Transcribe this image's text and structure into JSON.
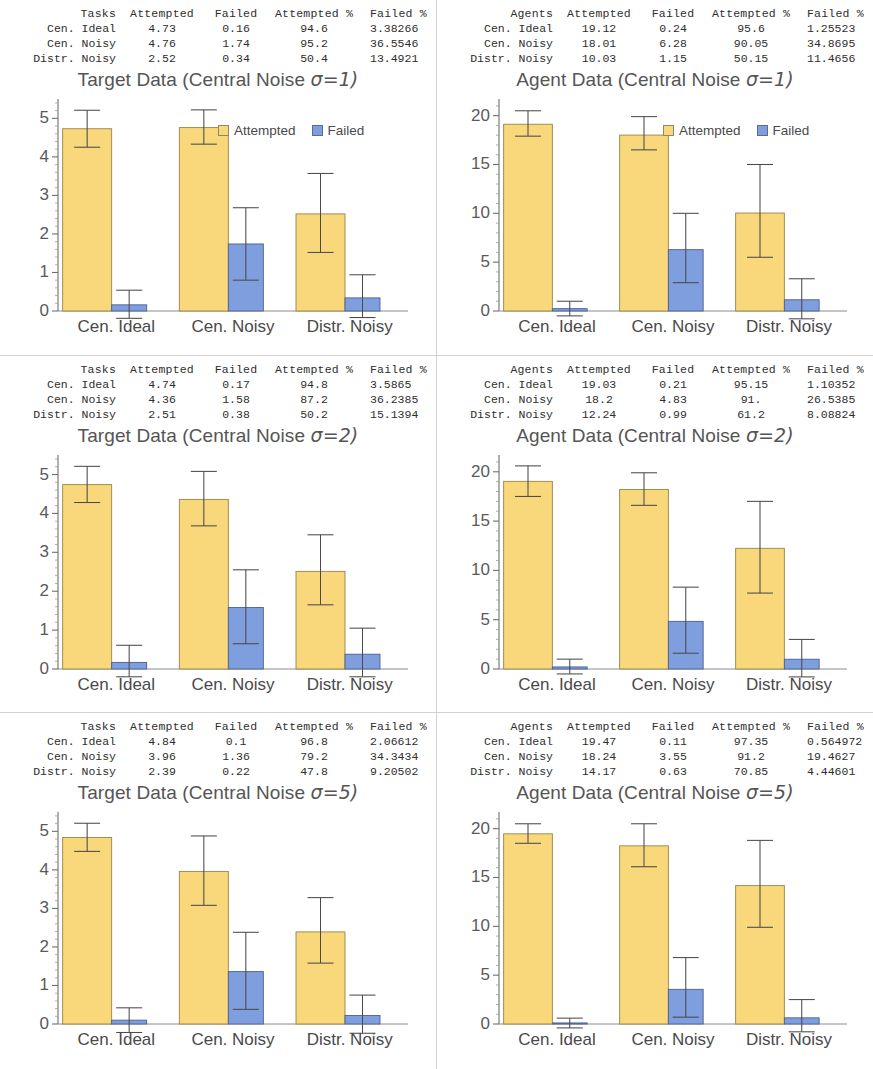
{
  "colors": {
    "attempted": "#f8d87a",
    "attempted_edge": "#9a8445",
    "failed": "#7e9ede",
    "failed_edge": "#4c5f96",
    "axis": "#6f6f6f",
    "text": "#4a4a4a",
    "panel_border": "#d2d2d2"
  },
  "legend": {
    "attempted": "Attempted",
    "failed": "Failed"
  },
  "categories": [
    "Cen. Ideal",
    "Cen. Noisy",
    "Distr. Noisy"
  ],
  "panels": [
    {
      "id": "target-sigma1",
      "table": {
        "headers": [
          "Tasks",
          "Attempted",
          "Failed",
          "Attempted %",
          "Failed %"
        ],
        "rows": [
          [
            "Cen. Ideal",
            "4.73",
            "0.16",
            "94.6",
            "3.38266"
          ],
          [
            "Cen. Noisy",
            "4.76",
            "1.74",
            "95.2",
            "36.5546"
          ],
          [
            "Distr. Noisy",
            "2.52",
            "0.34",
            "50.4",
            "13.4921"
          ]
        ]
      },
      "chart_data": {
        "type": "bar",
        "title": "Target Data (Central Noise σ=1)",
        "title_main": "Target Data (Central Noise ",
        "title_sigma": "σ=1)",
        "categories": [
          "Cen. Ideal",
          "Cen. Noisy",
          "Distr. Noisy"
        ],
        "series": [
          {
            "name": "Attempted",
            "values": [
              4.73,
              4.76,
              2.52
            ],
            "err_low": [
              4.25,
              4.33,
              1.52
            ],
            "err_high": [
              5.21,
              5.22,
              3.57
            ]
          },
          {
            "name": "Failed",
            "values": [
              0.16,
              1.74,
              0.34
            ],
            "err_low": [
              -0.19,
              0.8,
              -0.17
            ],
            "err_high": [
              0.54,
              2.68,
              0.94
            ]
          }
        ],
        "ylim": [
          0,
          5.45
        ],
        "yticks": [
          0,
          1,
          2,
          3,
          4,
          5
        ],
        "xlabel": "",
        "ylabel": "",
        "grid": false,
        "legend_position": "inside-top-right",
        "legend_visible": true
      }
    },
    {
      "id": "agent-sigma1",
      "table": {
        "headers": [
          "Agents",
          "Attempted",
          "Failed",
          "Attempted %",
          "Failed %"
        ],
        "rows": [
          [
            "Cen. Ideal",
            "19.12",
            "0.24",
            "95.6",
            "1.25523"
          ],
          [
            "Cen. Noisy",
            "18.01",
            "6.28",
            "90.05",
            "34.8695"
          ],
          [
            "Distr. Noisy",
            "10.03",
            "1.15",
            "50.15",
            "11.4656"
          ]
        ]
      },
      "chart_data": {
        "type": "bar",
        "title": "Agent Data (Central Noise σ=1)",
        "title_main": "Agent Data (Central Noise ",
        "title_sigma": "σ=1)",
        "categories": [
          "Cen. Ideal",
          "Cen. Noisy",
          "Distr. Noisy"
        ],
        "series": [
          {
            "name": "Attempted",
            "values": [
              19.12,
              18.01,
              10.03
            ],
            "err_low": [
              17.9,
              16.5,
              5.5
            ],
            "err_high": [
              20.5,
              19.9,
              15.0
            ]
          },
          {
            "name": "Failed",
            "values": [
              0.24,
              6.28,
              1.15
            ],
            "err_low": [
              -0.5,
              2.9,
              -0.8
            ],
            "err_high": [
              1.0,
              10.0,
              3.3
            ]
          }
        ],
        "ylim": [
          0,
          21.5
        ],
        "yticks": [
          0,
          5,
          10,
          15,
          20
        ],
        "xlabel": "",
        "ylabel": "",
        "grid": false,
        "legend_position": "inside-top-right",
        "legend_visible": true
      }
    },
    {
      "id": "target-sigma2",
      "table": {
        "headers": [
          "Tasks",
          "Attempted",
          "Failed",
          "Attempted %",
          "Failed %"
        ],
        "rows": [
          [
            "Cen. Ideal",
            "4.74",
            "0.17",
            "94.8",
            "3.5865"
          ],
          [
            "Cen. Noisy",
            "4.36",
            "1.58",
            "87.2",
            "36.2385"
          ],
          [
            "Distr. Noisy",
            "2.51",
            "0.38",
            "50.2",
            "15.1394"
          ]
        ]
      },
      "chart_data": {
        "type": "bar",
        "title": "Target Data (Central Noise σ=2)",
        "title_main": "Target Data (Central Noise ",
        "title_sigma": "σ=2)",
        "categories": [
          "Cen. Ideal",
          "Cen. Noisy",
          "Distr. Noisy"
        ],
        "series": [
          {
            "name": "Attempted",
            "values": [
              4.74,
              4.36,
              2.51
            ],
            "err_low": [
              4.28,
              3.68,
              1.65
            ],
            "err_high": [
              5.21,
              5.08,
              3.45
            ]
          },
          {
            "name": "Failed",
            "values": [
              0.17,
              1.58,
              0.38
            ],
            "err_low": [
              -0.2,
              0.65,
              -0.2
            ],
            "err_high": [
              0.61,
              2.55,
              1.05
            ]
          }
        ],
        "ylim": [
          0,
          5.45
        ],
        "yticks": [
          0,
          1,
          2,
          3,
          4,
          5
        ],
        "xlabel": "",
        "ylabel": "",
        "grid": false,
        "legend_position": "none",
        "legend_visible": false
      }
    },
    {
      "id": "agent-sigma2",
      "table": {
        "headers": [
          "Agents",
          "Attempted",
          "Failed",
          "Attempted %",
          "Failed %"
        ],
        "rows": [
          [
            "Cen. Ideal",
            "19.03",
            "0.21",
            "95.15",
            "1.10352"
          ],
          [
            "Cen. Noisy",
            "18.2",
            "4.83",
            "91.",
            "26.5385"
          ],
          [
            "Distr. Noisy",
            "12.24",
            "0.99",
            "61.2",
            "8.08824"
          ]
        ]
      },
      "chart_data": {
        "type": "bar",
        "title": "Agent Data (Central Noise σ=2)",
        "title_main": "Agent Data (Central Noise ",
        "title_sigma": "σ=2)",
        "categories": [
          "Cen. Ideal",
          "Cen. Noisy",
          "Distr. Noisy"
        ],
        "series": [
          {
            "name": "Attempted",
            "values": [
              19.03,
              18.2,
              12.24
            ],
            "err_low": [
              17.5,
              16.6,
              7.7
            ],
            "err_high": [
              20.6,
              19.9,
              17.0
            ]
          },
          {
            "name": "Failed",
            "values": [
              0.21,
              4.83,
              0.99
            ],
            "err_low": [
              -0.5,
              1.6,
              -0.8
            ],
            "err_high": [
              1.0,
              8.3,
              3.0
            ]
          }
        ],
        "ylim": [
          0,
          21.5
        ],
        "yticks": [
          0,
          5,
          10,
          15,
          20
        ],
        "xlabel": "",
        "ylabel": "",
        "grid": false,
        "legend_position": "none",
        "legend_visible": false
      }
    },
    {
      "id": "target-sigma5",
      "table": {
        "headers": [
          "Tasks",
          "Attempted",
          "Failed",
          "Attempted %",
          "Failed %"
        ],
        "rows": [
          [
            "Cen. Ideal",
            "4.84",
            "0.1",
            "96.8",
            "2.06612"
          ],
          [
            "Cen. Noisy",
            "3.96",
            "1.36",
            "79.2",
            "34.3434"
          ],
          [
            "Distr. Noisy",
            "2.39",
            "0.22",
            "47.8",
            "9.20502"
          ]
        ]
      },
      "chart_data": {
        "type": "bar",
        "title": "Target Data (Central Noise σ=5)",
        "title_main": "Target Data (Central Noise ",
        "title_sigma": "σ=5)",
        "categories": [
          "Cen. Ideal",
          "Cen. Noisy",
          "Distr. Noisy"
        ],
        "series": [
          {
            "name": "Attempted",
            "values": [
              4.84,
              3.96,
              2.39
            ],
            "err_low": [
              4.48,
              3.08,
              1.58
            ],
            "err_high": [
              5.21,
              4.88,
              3.28
            ]
          },
          {
            "name": "Failed",
            "values": [
              0.1,
              1.36,
              0.22
            ],
            "err_low": [
              -0.22,
              0.38,
              -0.24
            ],
            "err_high": [
              0.42,
              2.38,
              0.75
            ]
          }
        ],
        "ylim": [
          0,
          5.45
        ],
        "yticks": [
          0,
          1,
          2,
          3,
          4,
          5
        ],
        "xlabel": "",
        "ylabel": "",
        "grid": false,
        "legend_position": "none",
        "legend_visible": false
      }
    },
    {
      "id": "agent-sigma5",
      "table": {
        "headers": [
          "Agents",
          "Attempted",
          "Failed",
          "Attempted %",
          "Failed %"
        ],
        "rows": [
          [
            "Cen. Ideal",
            "19.47",
            "0.11",
            "97.35",
            "0.564972"
          ],
          [
            "Cen. Noisy",
            "18.24",
            "3.55",
            "91.2",
            "19.4627"
          ],
          [
            "Distr. Noisy",
            "14.17",
            "0.63",
            "70.85",
            "4.44601"
          ]
        ]
      },
      "chart_data": {
        "type": "bar",
        "title": "Agent Data (Central Noise σ=5)",
        "title_main": "Agent Data (Central Noise ",
        "title_sigma": "σ=5)",
        "categories": [
          "Cen. Ideal",
          "Cen. Noisy",
          "Distr. Noisy"
        ],
        "series": [
          {
            "name": "Attempted",
            "values": [
              19.47,
              18.24,
              14.17
            ],
            "err_low": [
              18.5,
              16.1,
              9.9
            ],
            "err_high": [
              20.5,
              20.5,
              18.8
            ]
          },
          {
            "name": "Failed",
            "values": [
              0.11,
              3.55,
              0.63
            ],
            "err_low": [
              -0.4,
              0.7,
              -0.8
            ],
            "err_high": [
              0.6,
              6.8,
              2.5
            ]
          }
        ],
        "ylim": [
          0,
          21.5
        ],
        "yticks": [
          0,
          5,
          10,
          15,
          20
        ],
        "xlabel": "",
        "ylabel": "",
        "grid": false,
        "legend_position": "none",
        "legend_visible": false
      }
    }
  ]
}
